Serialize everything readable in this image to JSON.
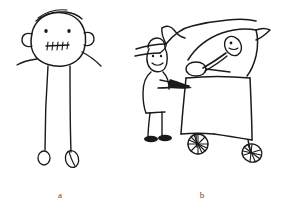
{
  "figure": {
    "background_color": "#ffffff",
    "ink_color": "#1a1a1a",
    "caption_color": "#4a4a4a",
    "width": 284,
    "height": 216
  },
  "panels": [
    {
      "id": "panel-a",
      "label": "a",
      "description": "Child's drawing of a tadpole-figure person: large round head with hair strokes, two dot eyes, two ears, a stitched mouth with cross-hatch teeth, short arms and two long legs ending in small oval feet"
    },
    {
      "id": "panel-b",
      "label": "b",
      "description": "Child's drawing of a small person wearing a hat standing beside a large animal with a long back, an oval shape on its body and two legs ending in hatched round hooves"
    }
  ],
  "captions": {
    "panel_a_label": "a",
    "panel_b_label": "b"
  }
}
